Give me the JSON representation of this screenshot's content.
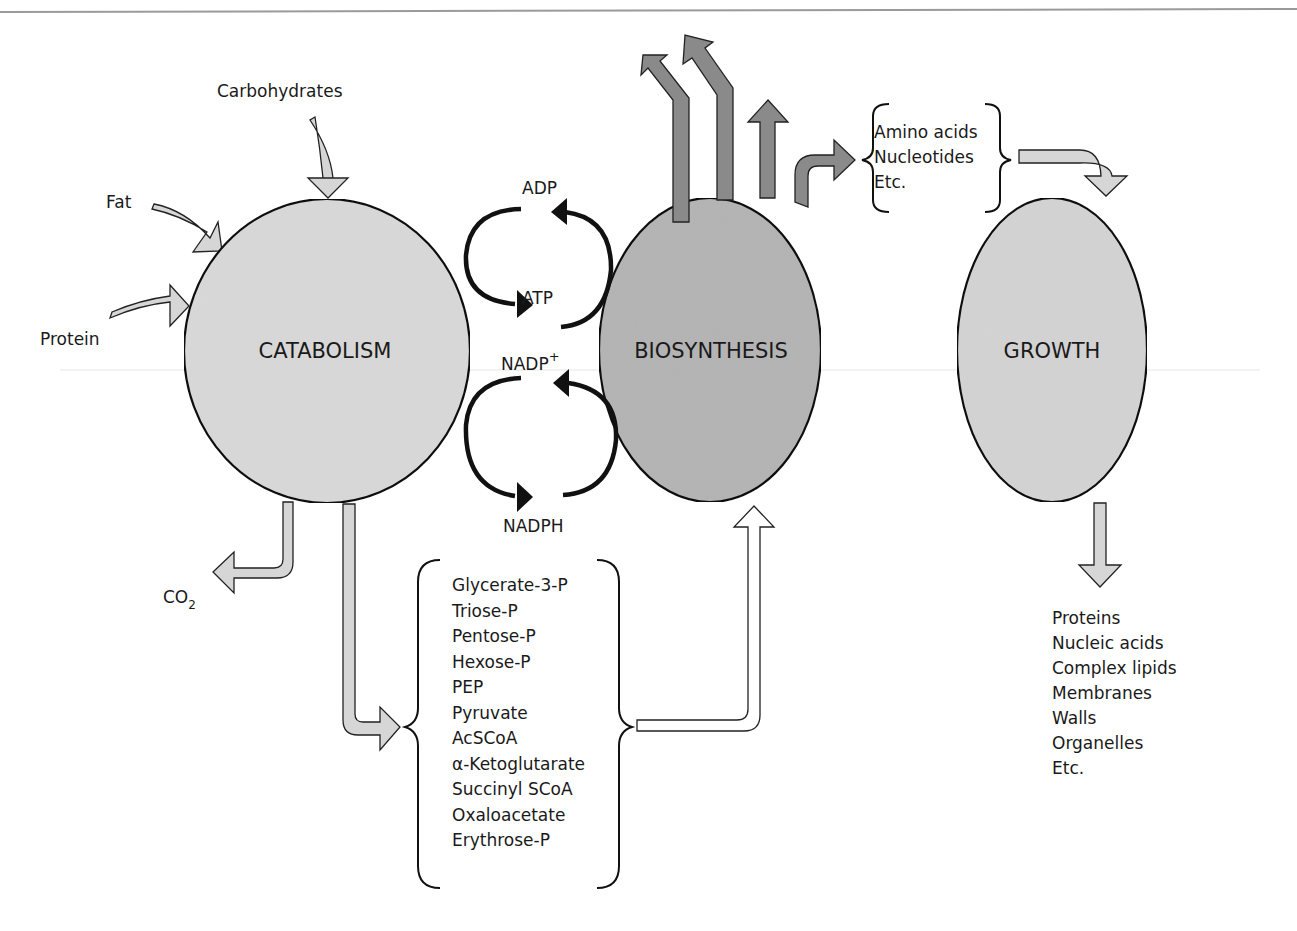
{
  "colors": {
    "light_fill": "#d9d9d9",
    "dark_fill": "#b5b5b5",
    "arrow_dark": "#8a8a8a",
    "arrow_light": "#d6d6d6",
    "outline": "#111111"
  },
  "nodes": {
    "catabolism": "CATABOLISM",
    "biosynthesis": "BIOSYNTHESIS",
    "growth": "GROWTH"
  },
  "inputs": {
    "carbohydrates": "Carbohydrates",
    "fat": "Fat",
    "protein": "Protein"
  },
  "cofactors": {
    "adp": "ADP",
    "atp": "ATP",
    "nadp": "NADP",
    "nadp_sup": "+",
    "nadph": "NADPH"
  },
  "co2": {
    "main": "CO",
    "sub": "2"
  },
  "precursors": [
    "Glycerate-3-P",
    "Triose-P",
    "Pentose-P",
    "Hexose-P",
    "PEP",
    "Pyruvate",
    "AcSCoA",
    "α-Ketoglutarate",
    "Succinyl SCoA",
    "Oxaloacetate",
    "Erythrose-P"
  ],
  "building_blocks": [
    "Amino acids",
    "Nucleotides",
    "Etc."
  ],
  "growth_products": [
    "Proteins",
    "Nucleic acids",
    "Complex lipids",
    "Membranes",
    "Walls",
    "Organelles",
    "Etc."
  ]
}
